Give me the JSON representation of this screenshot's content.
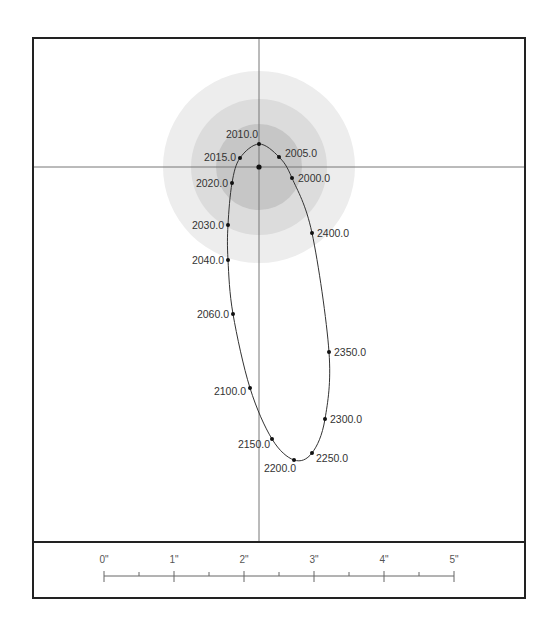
{
  "diagram": {
    "type": "orbit-plot",
    "frame": {
      "x": 33,
      "y": 38,
      "width": 492,
      "height": 560,
      "divider_y": 542,
      "stroke": "#222222"
    },
    "crosshair": {
      "x": 259,
      "y": 167,
      "color": "#777777"
    },
    "center_point": {
      "x": 259,
      "y": 167
    },
    "rings": [
      {
        "name": "outer",
        "r": 96,
        "color": "#ededed"
      },
      {
        "name": "middle",
        "r": 68,
        "color": "#dcdcdc"
      },
      {
        "name": "inner",
        "r": 43,
        "color": "#c6c6c6"
      }
    ],
    "orbit_points": [
      {
        "label": "2000.0",
        "x": 292,
        "y": 178,
        "lx": 298,
        "ly": 182,
        "anchor": "start"
      },
      {
        "label": "2005.0",
        "x": 279,
        "y": 157,
        "lx": 285,
        "ly": 157,
        "anchor": "start"
      },
      {
        "label": "2010.0",
        "x": 259,
        "y": 144,
        "lx": 258,
        "ly": 138,
        "anchor": "end"
      },
      {
        "label": "2015.0",
        "x": 240,
        "y": 158,
        "lx": 236,
        "ly": 161,
        "anchor": "end"
      },
      {
        "label": "2020.0",
        "x": 232,
        "y": 183,
        "lx": 228,
        "ly": 187,
        "anchor": "end"
      },
      {
        "label": "2030.0",
        "x": 228,
        "y": 225,
        "lx": 224,
        "ly": 229,
        "anchor": "end"
      },
      {
        "label": "2040.0",
        "x": 228,
        "y": 260,
        "lx": 224,
        "ly": 264,
        "anchor": "end"
      },
      {
        "label": "2060.0",
        "x": 233,
        "y": 314,
        "lx": 229,
        "ly": 318,
        "anchor": "end"
      },
      {
        "label": "2100.0",
        "x": 250,
        "y": 388,
        "lx": 246,
        "ly": 395,
        "anchor": "end"
      },
      {
        "label": "2150.0",
        "x": 272,
        "y": 439,
        "lx": 270,
        "ly": 448,
        "anchor": "end"
      },
      {
        "label": "2200.0",
        "x": 294,
        "y": 460,
        "lx": 296,
        "ly": 472,
        "anchor": "end"
      },
      {
        "label": "2250.0",
        "x": 312,
        "y": 453,
        "lx": 316,
        "ly": 462,
        "anchor": "start"
      },
      {
        "label": "2300.0",
        "x": 325,
        "y": 419,
        "lx": 330,
        "ly": 423,
        "anchor": "start"
      },
      {
        "label": "2350.0",
        "x": 329,
        "y": 352,
        "lx": 334,
        "ly": 356,
        "anchor": "start"
      },
      {
        "label": "2400.0",
        "x": 312,
        "y": 233,
        "lx": 317,
        "ly": 237,
        "anchor": "start"
      }
    ],
    "scale_bar": {
      "x0": 104,
      "px_per_unit": 70,
      "y": 576,
      "labels": [
        "0\"",
        "1\"",
        "2\"",
        "3\"",
        "4\"",
        "5\""
      ]
    }
  }
}
